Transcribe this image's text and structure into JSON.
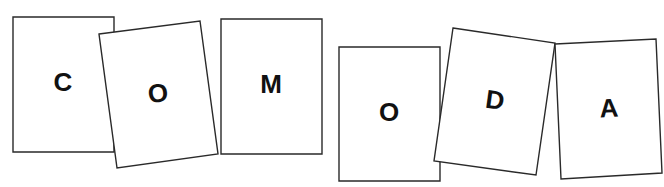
{
  "title": "",
  "word": "COMODA",
  "colors": {
    "background": "#ffffff",
    "card_fill": "#ffffff",
    "card_stroke": "#2a2a2a",
    "letter": "#111111"
  },
  "cards": [
    {
      "letter": "C",
      "points": "13,17 114,17 114,152 13,152",
      "cx": 63,
      "cy": 82,
      "rotate": 0
    },
    {
      "letter": "O",
      "points": "99,34 200,21 218,154 117,168",
      "cx": 158,
      "cy": 93,
      "rotate": -7
    },
    {
      "letter": "M",
      "points": "221,19 322,19 322,154 221,154",
      "cx": 271,
      "cy": 84,
      "rotate": 0
    },
    {
      "letter": "O",
      "points": "339,47 440,47 440,181 339,181",
      "cx": 389,
      "cy": 112,
      "rotate": 0
    },
    {
      "letter": "D",
      "points": "453,28 555,43 536,175 434,161",
      "cx": 495,
      "cy": 100,
      "rotate": 8
    },
    {
      "letter": "A",
      "points": "555,44 656,39 662,173 561,179",
      "cx": 609,
      "cy": 108,
      "rotate": -3
    }
  ]
}
